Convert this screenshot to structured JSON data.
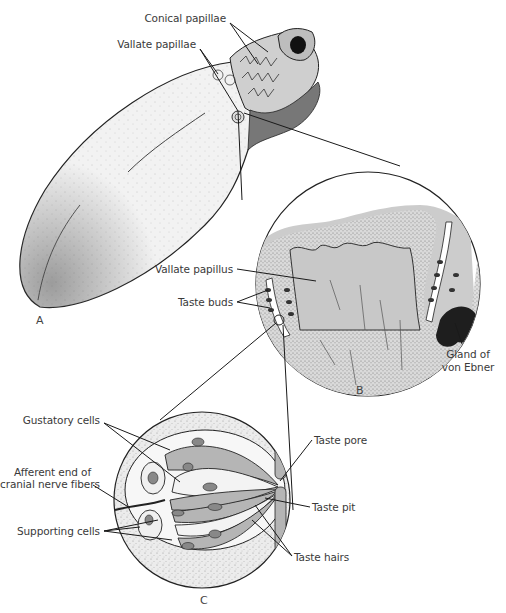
{
  "figure": {
    "type": "anatomical-diagram",
    "panels": [
      {
        "id": "A",
        "label": "A",
        "description": "whole tongue"
      },
      {
        "id": "B",
        "label": "B",
        "description": "section through vallate papilla"
      },
      {
        "id": "C",
        "label": "C",
        "description": "taste bud"
      }
    ],
    "labels": {
      "conical_papillae": "Conical papillae",
      "vallate_papillae": "Vallate papillae",
      "vallate_papillus": "Vallate papillus",
      "taste_buds": "Taste buds",
      "gland_line1": "Gland of",
      "gland_line2": "von Ebner",
      "gustatory_cells": "Gustatory cells",
      "afferent_line1": "Afferent end of",
      "afferent_line2": "cranial nerve fibers",
      "supporting_cells": "Supporting cells",
      "taste_pore": "Taste pore",
      "taste_pit": "Taste pit",
      "taste_hairs": "Taste hairs"
    },
    "colors": {
      "line": "#1a1a1a",
      "tongue_fill": "#efefef",
      "papilla_fill": "#d4d4d4",
      "epithelium_fill": "#e2e2e2",
      "gland_fill": "#222222",
      "cell_dark": "#b0b0b0",
      "cell_light": "#f4f4f4"
    }
  }
}
